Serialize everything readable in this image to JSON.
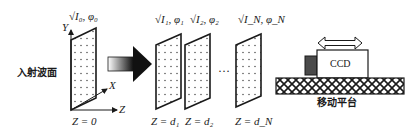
{
  "diagram": {
    "incident_wavefront_label": "入射波面",
    "axes": {
      "x": "X",
      "y": "Y",
      "z": "Z"
    },
    "planes": [
      {
        "id": "plane-0",
        "field_label": "√I₀, φ₀",
        "position_label": "Z = 0"
      },
      {
        "id": "plane-1",
        "field_label": "√I₁, φ₁",
        "position_label": "Z = d₁"
      },
      {
        "id": "plane-2",
        "field_label": "√I₂, φ₂",
        "position_label": "Z = d₂"
      },
      {
        "id": "plane-n",
        "field_label": "√I_N, φ_N",
        "position_label": "Z = d_N"
      }
    ],
    "ellipsis": "…",
    "ccd_label": "CCD",
    "platform_label": "移动平台",
    "colors": {
      "line": "#1a1a1a",
      "ccd_lens": "#4a4a4a",
      "arrow_gradient_start": "#ffffff",
      "arrow_gradient_end": "#111111"
    }
  }
}
